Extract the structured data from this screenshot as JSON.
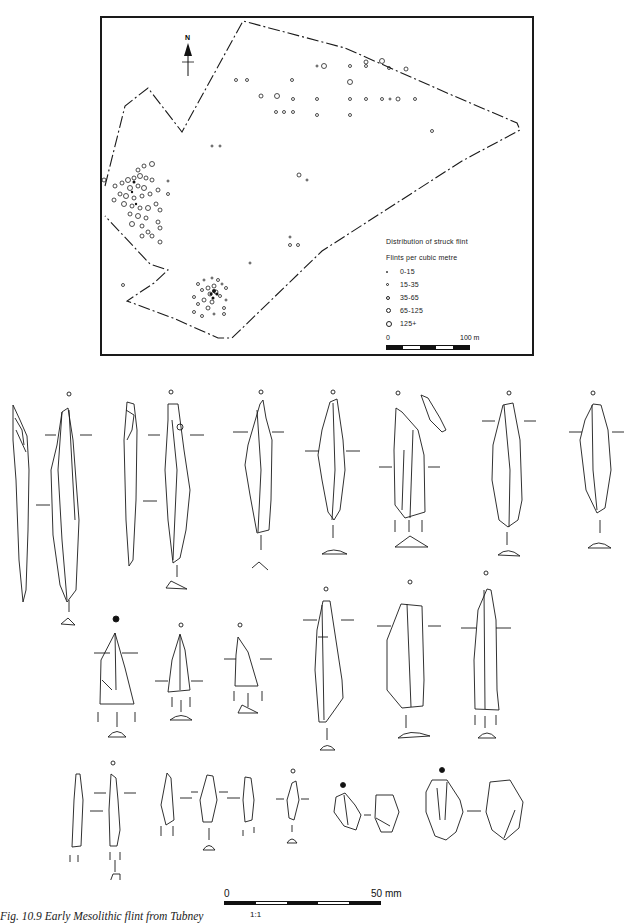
{
  "figure": {
    "caption": "Fig. 10.9 Early Mesolithic flint from Tubney",
    "scale_ratio": "1:1"
  },
  "map": {
    "north_label": "N",
    "legend": {
      "title": "Distribution of struck flint",
      "subtitle": "Flints per cubic metre",
      "classes": [
        {
          "label": "0-15",
          "symbol": "smallest-dot-icon",
          "size": 2
        },
        {
          "label": "15-35",
          "symbol": "small-circle-icon",
          "size": 3
        },
        {
          "label": "35-65",
          "symbol": "medium-circle-icon",
          "size": 4
        },
        {
          "label": "65-125",
          "symbol": "large-circle-icon",
          "size": 5
        },
        {
          "label": "125+",
          "symbol": "largest-circle-icon",
          "size": 6
        }
      ]
    },
    "scale": {
      "start": "0",
      "end": "100 m"
    }
  },
  "drawing_scale": {
    "start": "0",
    "end": "50 mm"
  },
  "artefacts": {
    "row1_count": 7,
    "row2_count": 6,
    "row3_count": 8
  },
  "colors": {
    "ink": "#1a1a1a",
    "paper": "#ffffff"
  }
}
